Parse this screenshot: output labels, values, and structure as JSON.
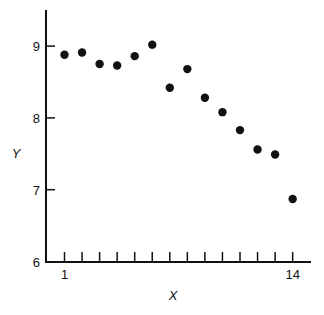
{
  "chart_data": {
    "type": "scatter",
    "title": "",
    "xlabel": "X",
    "ylabel": "Y",
    "xlim": [
      1,
      14
    ],
    "ylim": [
      6,
      9.5
    ],
    "grid": false,
    "legend": null,
    "x_ticks": [
      1,
      2,
      3,
      4,
      5,
      6,
      7,
      8,
      9,
      10,
      11,
      12,
      13,
      14
    ],
    "x_tick_labels": [
      "1",
      "",
      "",
      "",
      "",
      "",
      "",
      "",
      "",
      "",
      "",
      "",
      "",
      "14"
    ],
    "y_ticks": [
      6,
      7,
      8,
      9
    ],
    "y_tick_labels": [
      "6",
      "7",
      "8",
      "9"
    ],
    "series": [
      {
        "name": "data",
        "marker": "filled-circle",
        "color": "#111111",
        "points": [
          {
            "x": 1,
            "y": 8.88
          },
          {
            "x": 2,
            "y": 8.91
          },
          {
            "x": 3,
            "y": 8.75
          },
          {
            "x": 4,
            "y": 8.73
          },
          {
            "x": 5,
            "y": 8.86
          },
          {
            "x": 6,
            "y": 9.02
          },
          {
            "x": 7,
            "y": 8.42
          },
          {
            "x": 8,
            "y": 8.68
          },
          {
            "x": 9,
            "y": 8.28
          },
          {
            "x": 10,
            "y": 8.08
          },
          {
            "x": 11,
            "y": 7.83
          },
          {
            "x": 12,
            "y": 7.56
          },
          {
            "x": 13,
            "y": 7.49
          },
          {
            "x": 14,
            "y": 6.87
          }
        ]
      }
    ]
  }
}
